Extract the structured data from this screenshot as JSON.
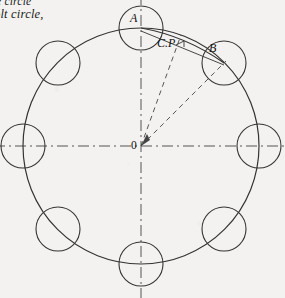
{
  "page": {
    "background_color": "#f3f2f0",
    "ink_color": "#2b2b2b"
  },
  "caption": {
    "line1": "e circle",
    "line2": "olt circle,"
  },
  "diagram": {
    "center_label": "0",
    "point_a_label": "A",
    "point_b_label": "B",
    "chord_label": "C.P",
    "center": {
      "x": 141,
      "y": 146
    },
    "bolt_circle_radius": 118,
    "bolt_hole_radius": 22,
    "bolt_count": 8,
    "bolt_start_angle_deg": 90,
    "bolt_spacing_deg": 45,
    "bolt_positions": [
      {
        "label": "A",
        "angle_deg": 90,
        "x": 141,
        "y": 28
      },
      {
        "label": "B",
        "angle_deg": 45,
        "x": 224,
        "y": 63
      },
      {
        "label": "",
        "angle_deg": 0,
        "x": 259,
        "y": 146
      },
      {
        "label": "",
        "angle_deg": 315,
        "x": 224,
        "y": 229
      },
      {
        "label": "",
        "angle_deg": 270,
        "x": 141,
        "y": 264
      },
      {
        "label": "",
        "angle_deg": 225,
        "x": 58,
        "y": 229
      },
      {
        "label": "",
        "angle_deg": 180,
        "x": 23,
        "y": 146
      },
      {
        "label": "",
        "angle_deg": 135,
        "x": 58,
        "y": 63
      }
    ],
    "centerlines": [
      {
        "name": "vertical-centerline",
        "orientation": "vertical",
        "x": 141
      },
      {
        "name": "horizontal-centerline",
        "orientation": "horizontal",
        "y": 146
      }
    ],
    "radii": [
      {
        "name": "radius-to-chord-point",
        "angle_deg": 70
      },
      {
        "name": "radius-to-b",
        "angle_deg": 45
      }
    ],
    "chord": {
      "from": "A",
      "to": "B",
      "style": "solid-arc"
    },
    "line_style": {
      "centerline": "dash-dot",
      "radius": "dashed",
      "circle": "solid"
    }
  }
}
